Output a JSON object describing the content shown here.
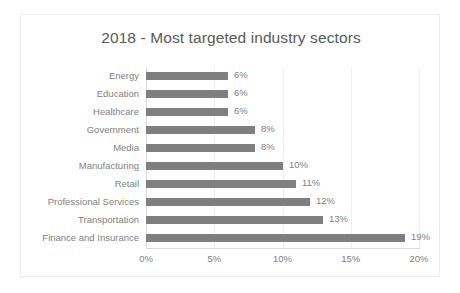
{
  "chart_data": {
    "type": "bar",
    "orientation": "horizontal",
    "title": "2018 - Most targeted industry sectors",
    "xlabel": "",
    "ylabel": "",
    "xlim": [
      0,
      20
    ],
    "grid": true,
    "legend": false,
    "value_suffix": "%",
    "categories": [
      "Energy",
      "Education",
      "Healthcare",
      "Government",
      "Media",
      "Manufacturing",
      "Retail",
      "Professional Services",
      "Transportation",
      "Finance and Insurance"
    ],
    "values": [
      6,
      6,
      6,
      8,
      8,
      10,
      11,
      12,
      13,
      19
    ],
    "data_labels": [
      "6%",
      "6%",
      "6%",
      "8%",
      "8%",
      "10%",
      "11%",
      "12%",
      "13%",
      "19%"
    ],
    "xticks": [
      0,
      5,
      10,
      15,
      20
    ],
    "xtick_labels": [
      "0%",
      "5%",
      "10%",
      "15%",
      "20%"
    ],
    "bar_color": "#7f7f7f",
    "gridline_color": "#efefef",
    "axis_color": "#d9d9d9",
    "title_color": "#595959",
    "label_color": "#808080",
    "background": "#ffffff",
    "border_color": "#ededed"
  }
}
